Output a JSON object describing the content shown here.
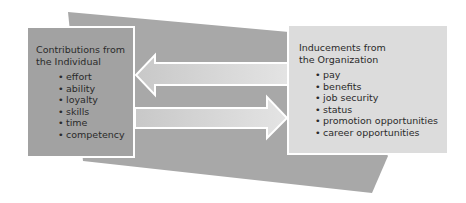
{
  "diagram": {
    "colors": {
      "background_band": "#a8a8a8",
      "left_box": "#a2a2a2",
      "right_box": "#dcdcdc",
      "arrow_fill": "#d6d6d6",
      "outline": "#ffffff"
    },
    "left_box": {
      "title": "Contributions from\nthe Individual",
      "items": [
        "effort",
        "ability",
        "loyalty",
        "skills",
        "time",
        "competency"
      ]
    },
    "right_box": {
      "title": "Inducements from\nthe Organization",
      "items": [
        "pay",
        "benefits",
        "job security",
        "status",
        "promotion opportunities",
        "career opportunities"
      ]
    },
    "arrows": [
      {
        "direction": "left",
        "from": "Inducements from the Organization",
        "to": "Contributions from the Individual"
      },
      {
        "direction": "right",
        "from": "Contributions from the Individual",
        "to": "Inducements from the Organization"
      }
    ],
    "bullet": "•"
  }
}
